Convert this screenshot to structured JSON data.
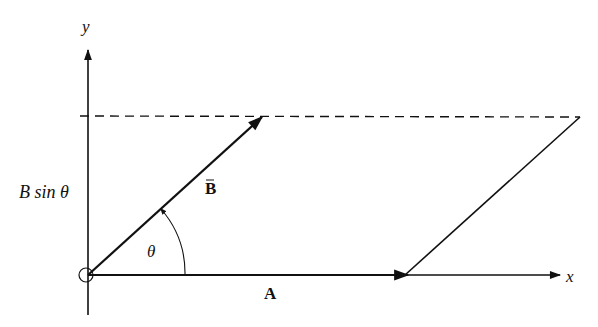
{
  "diagram": {
    "axes": {
      "x_label": "x",
      "y_label": "y"
    },
    "vectors": [
      {
        "name": "A",
        "label": "A",
        "from": [
          88,
          275
        ],
        "to": [
          408,
          275
        ]
      },
      {
        "name": "B",
        "label": "B",
        "from": [
          88,
          275
        ],
        "to": [
          262,
          117
        ]
      }
    ],
    "angle": {
      "label": "θ",
      "between": [
        "A",
        "B"
      ]
    },
    "height_label": "B sin θ",
    "dashed_line": {
      "description": "horizontal line at height B sin θ",
      "y": 117
    },
    "parallelogram_vertices": [
      [
        88,
        275
      ],
      [
        408,
        275
      ],
      [
        580,
        117
      ],
      [
        262,
        117
      ]
    ],
    "colors": {
      "ink": "#111111",
      "background": "#ffffff"
    }
  }
}
